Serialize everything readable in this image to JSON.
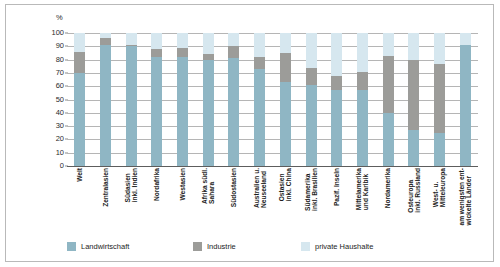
{
  "chart_data": {
    "type": "bar",
    "subtype": "stacked-bar-100",
    "title": "",
    "xlabel": "",
    "ylabel": "%",
    "unit_label": "%",
    "ylim": [
      0,
      100
    ],
    "yticks": [
      100,
      90,
      80,
      70,
      60,
      50,
      40,
      30,
      20,
      10,
      0
    ],
    "grid": true,
    "legend_position": "bottom-left",
    "categories": [
      "Welt",
      "Zentralasien",
      "Südasien inkl. Indien",
      "Nordafrika",
      "Westasien",
      "Afrika südl. Sahara",
      "Südostasien",
      "Australien u. Neuseeland",
      "Ostasien inkl. China",
      "Südamerika inkl. Brasilien",
      "Pazif. Inseln",
      "Mittelamerika und Karibik",
      "Nordamerika",
      "Osteuropa inkl. Russland",
      "West- u. Mitteleuropa",
      "am wenigsten entwickelte Länder"
    ],
    "series": [
      {
        "name": "Landwirtschaft",
        "color": "#8fb6c4",
        "values": [
          70,
          91,
          90,
          82,
          82,
          80,
          81,
          73,
          63,
          61,
          57,
          57,
          40,
          27,
          25,
          91
        ]
      },
      {
        "name": "Industrie",
        "color": "#9c9c99",
        "values": [
          16,
          5,
          1,
          6,
          7,
          4,
          9,
          9,
          22,
          13,
          11,
          14,
          43,
          53,
          52,
          0
        ]
      },
      {
        "name": "private Haushalte",
        "color": "#d6e7ef",
        "values": [
          14,
          4,
          9,
          12,
          11,
          16,
          10,
          18,
          15,
          26,
          32,
          29,
          17,
          20,
          23,
          9
        ]
      }
    ],
    "legend": [
      {
        "label": "Landwirtschaft",
        "color": "#8fb6c4"
      },
      {
        "label": "Industrie",
        "color": "#9c9c99"
      },
      {
        "label": "private Haushalte",
        "color": "#d6e7ef"
      }
    ]
  },
  "x_label_lines": [
    [
      "Welt"
    ],
    [
      "Zentralasien"
    ],
    [
      "Südasien",
      "inkl. Indien"
    ],
    [
      "Nordafrika"
    ],
    [
      "Westasien"
    ],
    [
      "Afrika südl.",
      "Sahara"
    ],
    [
      "Südostasien"
    ],
    [
      "Australien u.",
      "Neuseeland"
    ],
    [
      "Ostasien",
      "inkl. China"
    ],
    [
      "Südamerika",
      "inkl. Brasilien"
    ],
    [
      "Pazif. Inseln"
    ],
    [
      "Mittelamerika",
      "und Karibik"
    ],
    [
      "Nordamerika"
    ],
    [
      "Osteuropa",
      "inkl. Russland"
    ],
    [
      "West- u.",
      "Mitteleuropa"
    ],
    [
      "am wenigsten ent-",
      "wickelte Länder"
    ]
  ]
}
